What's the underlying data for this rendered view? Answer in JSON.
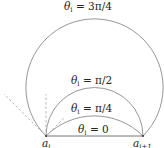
{
  "figure": {
    "points": [
      {
        "id": "a_i",
        "label_base": "a",
        "label_sub": "i"
      },
      {
        "id": "a_i_plus_1",
        "label_base": "a",
        "label_sub": "i+1"
      }
    ],
    "arcs": [
      {
        "id": "theta-3pi4",
        "label_var": "θ",
        "label_sub": "i",
        "label_rest": " = 3π/4"
      },
      {
        "id": "theta-pi2",
        "label_var": "θ",
        "label_sub": "i",
        "label_rest": " = π/2"
      },
      {
        "id": "theta-pi4",
        "label_var": "θ",
        "label_sub": "i",
        "label_rest": " = π/4"
      },
      {
        "id": "theta-0",
        "label_var": "θ",
        "label_sub": "i",
        "label_rest": " = 0"
      }
    ],
    "tangent_lines": [
      "tangent-3pi4",
      "tangent-pi2",
      "tangent-pi4"
    ],
    "colors": {
      "arc": "#8a8a8a",
      "chord": "#666666",
      "dashed": "#b0b0b0",
      "text": "#222222"
    }
  }
}
